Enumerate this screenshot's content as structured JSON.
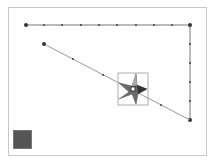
{
  "canvas": {
    "border_color": "#c8c8c8",
    "background": "#ffffff"
  },
  "polyline_top": {
    "start": [
      26,
      25
    ],
    "corner": [
      190,
      25
    ],
    "end": [
      190,
      120
    ],
    "color": "#777777"
  },
  "diagonal_path": {
    "start": [
      44,
      44
    ],
    "end": [
      190,
      120
    ],
    "color": "#999999"
  },
  "selection": {
    "box": [
      118,
      73,
      30,
      32
    ],
    "shape": "star",
    "handle_center": [
      133,
      89
    ]
  },
  "color_swatch": {
    "color": "#555555"
  }
}
